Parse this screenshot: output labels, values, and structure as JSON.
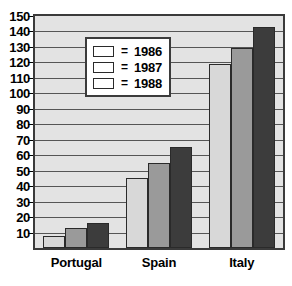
{
  "chart_data": {
    "type": "bar",
    "title": "",
    "subtitle": "",
    "xlabel": "",
    "ylabel": "",
    "categories": [
      "Portugal",
      "Spain",
      "Italy"
    ],
    "series": [
      {
        "name": "1986",
        "values": [
          8,
          45,
          119
        ],
        "color": "#d8d8d8"
      },
      {
        "name": "1987",
        "values": [
          13,
          55,
          129
        ],
        "color": "#9a9a9a"
      },
      {
        "name": "1988",
        "values": [
          16,
          65,
          143
        ],
        "color": "#3c3c3c"
      }
    ],
    "ylim": [
      0,
      150
    ],
    "ytick_values": [
      10,
      20,
      30,
      40,
      50,
      60,
      70,
      80,
      90,
      100,
      110,
      120,
      130,
      140,
      150
    ],
    "ytick_labels": [
      "10",
      "20",
      "30",
      "40",
      "50",
      "60",
      "70",
      "80",
      "90",
      "100",
      "110",
      "120",
      "130",
      "140",
      "150"
    ],
    "grid": true,
    "legend_position": "upper-left",
    "legend_separator": "=",
    "plot_background": "#e3e3e3",
    "axis_color": "#3b3b3b"
  }
}
